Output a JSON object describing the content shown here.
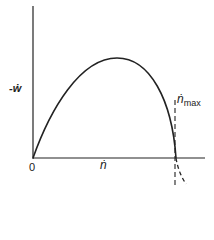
{
  "diagram": {
    "y_axis_label": "-ẇ",
    "x_axis_label": "ṅ",
    "origin_label": "0",
    "marker_label_main": "ṅ",
    "marker_label_sub": "max",
    "curve": "concave-down arc starting at origin, peaking near mid-range, crossing x-axis at ṅ_max",
    "marker_style": "dashed vertical line at ṅ_max"
  },
  "colors": {
    "line": "#222222",
    "background": "#ffffff"
  }
}
